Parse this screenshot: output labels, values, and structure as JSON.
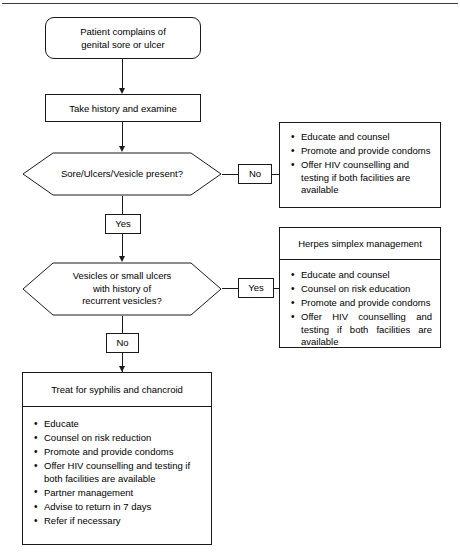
{
  "diagram": {
    "nodes": {
      "start": {
        "label": "Patient complains of\ngenital sore or ulcer",
        "shape": "rounded-rectangle"
      },
      "history": {
        "label": "Take history and examine",
        "shape": "rectangle"
      },
      "decision1": {
        "label": "Sore/Ulcers/Vesicle present?",
        "shape": "hexagon"
      },
      "decision2": {
        "label": "Vesicles or small ulcers\nwith history of\nrecurrent vesicles?",
        "shape": "hexagon"
      },
      "treat": {
        "label": "Treat for syphilis and chancroid",
        "shape": "rectangle"
      }
    },
    "edge_labels": {
      "d1_no": "No",
      "d1_yes": "Yes",
      "d2_yes": "Yes",
      "d2_no": "No"
    },
    "panels": {
      "no_ulcer": {
        "title": "",
        "items": [
          "Educate and counsel",
          "Promote and provide condoms",
          "Offer HIV counselling and testing if both facilities are available"
        ]
      },
      "herpes": {
        "title": "Herpes simplex management",
        "items": [
          "Educate and counsel",
          "Counsel on risk education",
          "Promote and provide condoms",
          "Offer HIV counselling and testing if both facilities are available"
        ]
      },
      "treat_actions": {
        "title": "",
        "items": [
          "Educate",
          "Counsel on risk reduction",
          "Promote and provide condoms",
          "Offer HIV counselling and testing if both facilities are available",
          "Partner management",
          "Advise to return in 7 days",
          "Refer if necessary"
        ]
      }
    },
    "colors": {
      "stroke": "#1a1a1a",
      "background": "#ffffff",
      "text": "#000000"
    }
  }
}
